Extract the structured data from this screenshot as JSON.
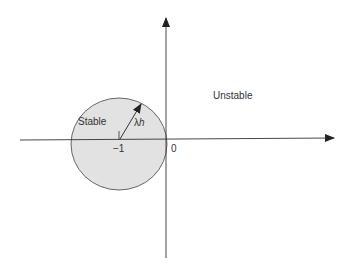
{
  "diagram": {
    "regions": {
      "stable_label": "Stable",
      "unstable_label": "Unstable"
    },
    "axis_labels": {
      "origin": "0",
      "center_tick": "−1"
    },
    "radius_label": {
      "lambda": "λ",
      "h": "h"
    },
    "colors": {
      "disk_fill": "#e2e2e2",
      "line": "#333333"
    }
  }
}
